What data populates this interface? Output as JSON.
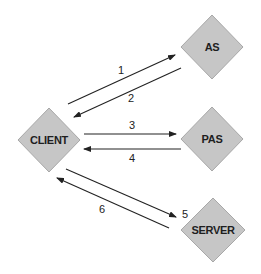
{
  "diagram": {
    "type": "authentication-flow",
    "colors": {
      "node_fill": "#c6c6c6",
      "node_stroke": "#a8a8a8",
      "text": "#1e1e1e",
      "edge": "#222222",
      "background": "#ffffff"
    },
    "nodes": {
      "client": {
        "label": "CLIENT",
        "shape": "diamond"
      },
      "as": {
        "label": "AS",
        "shape": "diamond"
      },
      "pas": {
        "label": "PAS",
        "shape": "diamond"
      },
      "server": {
        "label": "SERVER",
        "shape": "diamond"
      }
    },
    "edges": [
      {
        "label": "1",
        "from": "CLIENT",
        "to": "AS"
      },
      {
        "label": "2",
        "from": "AS",
        "to": "CLIENT"
      },
      {
        "label": "3",
        "from": "CLIENT",
        "to": "PAS"
      },
      {
        "label": "4",
        "from": "PAS",
        "to": "CLIENT"
      },
      {
        "label": "5",
        "from": "CLIENT",
        "to": "SERVER"
      },
      {
        "label": "6",
        "from": "SERVER",
        "to": "CLIENT"
      }
    ]
  }
}
